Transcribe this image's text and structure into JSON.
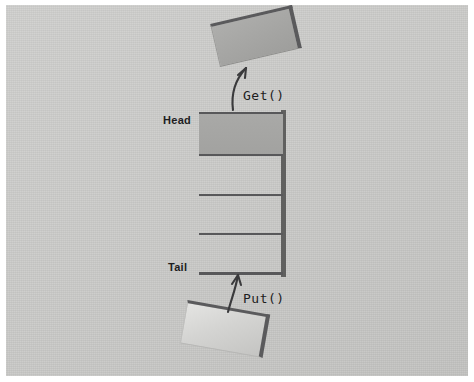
{
  "diagram": {
    "background_color": "#c9c9c7",
    "line_color": "#58585a",
    "filled_cell_color": "#a9a9a7",
    "labels": {
      "head": "Head",
      "tail": "Tail",
      "get": "Get()",
      "put": "Put()"
    },
    "queue": {
      "cells": [
        {
          "index": 0,
          "state": "filled"
        },
        {
          "index": 1,
          "state": "empty"
        },
        {
          "index": 2,
          "state": "empty"
        },
        {
          "index": 3,
          "state": "empty"
        }
      ]
    },
    "boxes": {
      "get_item": {
        "label": "",
        "fill": "#a5a5a3",
        "rotation_deg": -13
      },
      "put_item": {
        "label": "",
        "fill": "#d4d4d2",
        "rotation_deg": 10
      }
    },
    "arrows": [
      {
        "name": "get-arrow",
        "direction": "up-right",
        "from": "queue-head",
        "to": "get-item"
      },
      {
        "name": "put-arrow",
        "direction": "up",
        "from": "put-item",
        "to": "queue-tail"
      }
    ]
  }
}
